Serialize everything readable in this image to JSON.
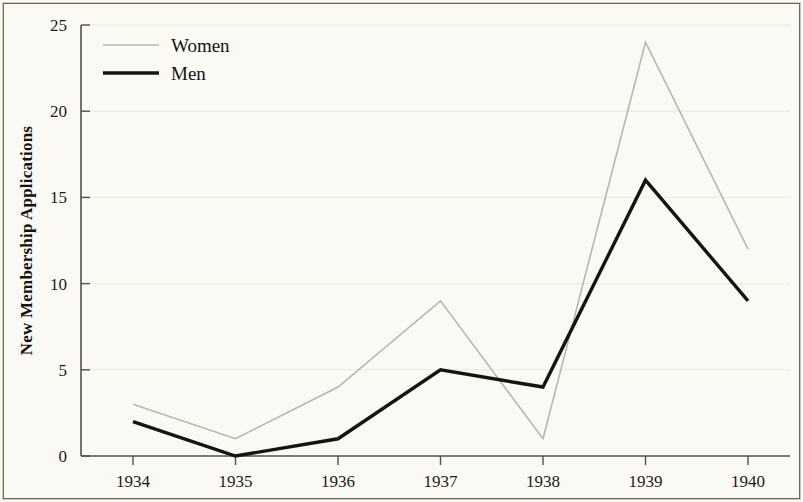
{
  "chart_data": {
    "type": "line",
    "title": "",
    "xlabel": "",
    "ylabel": "New Membership Applications",
    "categories": [
      "1934",
      "1935",
      "1936",
      "1937",
      "1938",
      "1939",
      "1940"
    ],
    "x": [
      1934,
      1935,
      1936,
      1937,
      1938,
      1939,
      1940
    ],
    "series": [
      {
        "name": "Women",
        "values": [
          3,
          1,
          4,
          9,
          1,
          24,
          12
        ],
        "color": "#b9b7ab",
        "line_width": 1.6
      },
      {
        "name": "Men",
        "values": [
          2,
          0,
          1,
          5,
          4,
          16,
          9
        ],
        "color": "#16140f",
        "line_width": 3.4
      }
    ],
    "ylim": [
      0,
      25
    ],
    "y_ticks": [
      0,
      5,
      10,
      15,
      20,
      25
    ],
    "y_tick_labels": [
      "0",
      "5",
      "10",
      "15",
      "20",
      "25"
    ],
    "x_tick_labels": [
      "1934",
      "1935",
      "1936",
      "1937",
      "1938",
      "1939",
      "1940"
    ],
    "grid": true,
    "grid_axis": "y",
    "legend_position": "top-left",
    "legend_entries": [
      "Women",
      "Men"
    ],
    "background_color": "#faf9f4",
    "axis_color": "#55514a",
    "grid_color": "#ece8dc"
  }
}
